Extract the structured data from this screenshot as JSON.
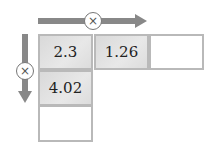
{
  "horizontal_operation": {
    "symbol": "×",
    "direction": "right"
  },
  "vertical_operation": {
    "symbol": "×",
    "direction": "down"
  },
  "grid": {
    "row1": [
      "2.3",
      "1.26",
      ""
    ],
    "col1": [
      "2.3",
      "4.02",
      ""
    ]
  },
  "cells": {
    "r1c1": "2.3",
    "r1c2": "1.26",
    "r1c3": "",
    "r2c1": "4.02",
    "r3c1": ""
  },
  "colors": {
    "arrow": "#888888",
    "cell_border": "#b9b9b9",
    "filled_cell": "#dedede"
  }
}
